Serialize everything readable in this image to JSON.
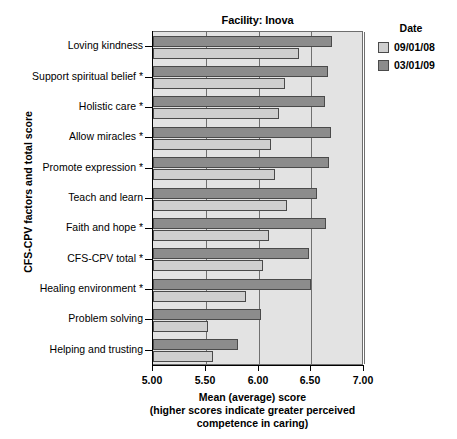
{
  "chart_data": {
    "type": "bar",
    "orientation": "horizontal",
    "title": "Facility: Inova",
    "xlabel_lines": [
      "Mean (average) score",
      "(higher scores indicate greater perceived",
      "competence in caring)"
    ],
    "ylabel": "CFS-CPV factors and total score",
    "xlim": [
      5.0,
      7.0
    ],
    "xticks": [
      "5.00",
      "5.50",
      "6.00",
      "6.50",
      "7.00"
    ],
    "xtick_values": [
      5.0,
      5.5,
      6.0,
      6.5,
      7.0
    ],
    "grid": true,
    "legend_position": "right",
    "legend_title": "Date",
    "categories": [
      "Loving kindness",
      "Support spiritual belief *",
      "Holistic care *",
      "Allow miracles *",
      "Promote expression *",
      "Teach and learn",
      "Faith and hope *",
      "CFS-CPV total *",
      "Healing environment *",
      "Problem solving",
      "Helping and trusting"
    ],
    "series": [
      {
        "name": "03/01/09",
        "color": "#8c8c8c",
        "values": [
          6.7,
          6.66,
          6.63,
          6.69,
          6.67,
          6.55,
          6.64,
          6.48,
          6.5,
          6.02,
          5.81
        ]
      },
      {
        "name": "09/01/08",
        "color": "#cfcfcf",
        "values": [
          6.38,
          6.25,
          6.19,
          6.12,
          6.16,
          6.27,
          6.1,
          6.04,
          5.88,
          5.52,
          5.57
        ]
      }
    ]
  },
  "legend": {
    "title": "Date",
    "entries": [
      {
        "label": "09/01/08",
        "swatch": "old"
      },
      {
        "label": "03/01/09",
        "swatch": "new"
      }
    ]
  }
}
